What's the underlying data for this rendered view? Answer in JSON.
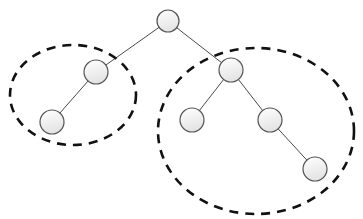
{
  "diagram": {
    "type": "binary-tree",
    "caption_cropped": "",
    "colors": {
      "edge": "#4a4a4a",
      "node_stroke": "#555555",
      "node_fill_top": "#ffffff",
      "node_fill_bottom": "#e4e4e4",
      "group_stroke": "#111111"
    },
    "nodes": [
      {
        "id": "root",
        "cx": 168,
        "cy": 21,
        "r": 11
      },
      {
        "id": "L",
        "cx": 96,
        "cy": 72,
        "r": 12
      },
      {
        "id": "LL",
        "cx": 52,
        "cy": 122,
        "r": 12
      },
      {
        "id": "R",
        "cx": 231,
        "cy": 70,
        "r": 12
      },
      {
        "id": "RL",
        "cx": 192,
        "cy": 120,
        "r": 12
      },
      {
        "id": "RR",
        "cx": 270,
        "cy": 120,
        "r": 12
      },
      {
        "id": "RRR",
        "cx": 315,
        "cy": 169,
        "r": 12
      }
    ],
    "edges": [
      {
        "from": "root",
        "to": "L"
      },
      {
        "from": "L",
        "to": "LL"
      },
      {
        "from": "root",
        "to": "R"
      },
      {
        "from": "R",
        "to": "RL"
      },
      {
        "from": "R",
        "to": "RR"
      },
      {
        "from": "RR",
        "to": "RRR"
      }
    ],
    "groups": [
      {
        "id": "left-subtree",
        "cx": 73,
        "cy": 95,
        "rx": 63,
        "ry": 50
      },
      {
        "id": "right-subtree",
        "cx": 256,
        "cy": 131,
        "rx": 98,
        "ry": 83
      }
    ]
  }
}
